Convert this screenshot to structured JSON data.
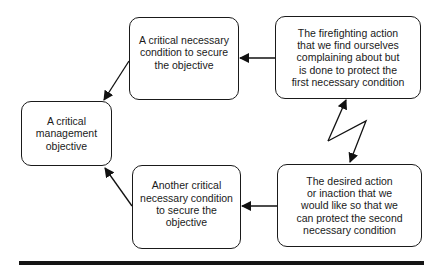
{
  "diagram": {
    "type": "evaporating-cloud",
    "nodes": [
      {
        "id": "objective",
        "label": "A critical management objective",
        "lines": [
          "A critical",
          "management",
          "objective"
        ]
      },
      {
        "id": "condition1",
        "label": "A critical necessary condition to secure the objective",
        "lines": [
          "A critical necessary",
          "condition to secure",
          "the objective"
        ]
      },
      {
        "id": "firefighting",
        "label": "The firefighting action that we find ourselves complaining about but is done to protect the first necessary condition",
        "lines": [
          "The firefighting action",
          "that we find ourselves",
          "complaining about but",
          "is done to protect the",
          "first necessary condition"
        ]
      },
      {
        "id": "condition2",
        "label": "Another critical necessary condition to secure the objective",
        "lines": [
          "Another critical",
          "necessary condition",
          "to secure the",
          "objective"
        ]
      },
      {
        "id": "desired",
        "label": "The desired action or inaction that we would like so that we can protect the second necessary condition",
        "lines": [
          "The desired action",
          "or inaction that we",
          "would like so that we",
          "can protect the second",
          "necessary condition"
        ]
      }
    ],
    "edges": [
      {
        "from": "condition1",
        "to": "objective",
        "style": "arrow"
      },
      {
        "from": "condition2",
        "to": "objective",
        "style": "arrow"
      },
      {
        "from": "firefighting",
        "to": "condition1",
        "style": "arrow"
      },
      {
        "from": "desired",
        "to": "condition2",
        "style": "arrow"
      },
      {
        "from": "firefighting",
        "to": "desired",
        "style": "conflict-lightning",
        "bidirectional": true
      }
    ]
  }
}
